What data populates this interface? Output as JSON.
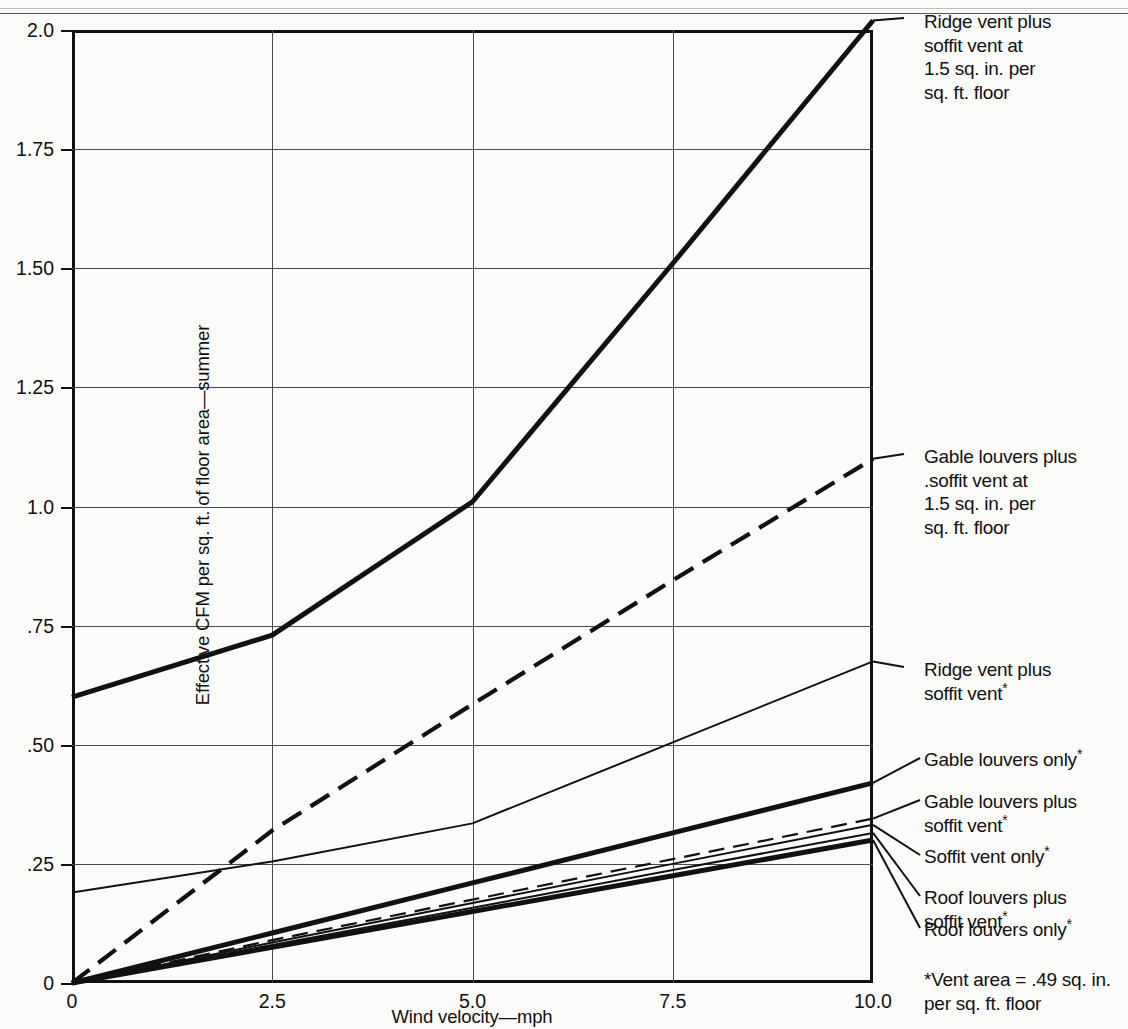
{
  "chart_data": {
    "type": "line",
    "title": "",
    "xlabel": "Wind velocity—mph",
    "ylabel": "Effective CFM per sq. ft. of floor area—summer",
    "xlim": [
      0,
      10
    ],
    "ylim": [
      0,
      2.0
    ],
    "xticks": [
      "0",
      "2.5",
      "5.0",
      "7.5",
      "10.0"
    ],
    "xtick_values": [
      0,
      2.5,
      5.0,
      7.5,
      10.0
    ],
    "yticks": [
      "0",
      ".25",
      ".50",
      ".75",
      "1.0",
      "1.25",
      "1.50",
      "1.75",
      "2.0"
    ],
    "ytick_values": [
      0,
      0.25,
      0.5,
      0.75,
      1.0,
      1.25,
      1.5,
      1.75,
      2.0
    ],
    "grid": true,
    "legend_position": "right-callouts",
    "x": [
      0,
      2.5,
      5.0,
      7.5,
      10.0
    ],
    "series": [
      {
        "name": "Ridge vent plus soffit vent at 1.5 sq. in. per sq. ft. floor",
        "values": [
          0.6,
          0.73,
          1.01,
          1.51,
          2.02
        ],
        "style": "solid-heavy"
      },
      {
        "name": "Gable louvers plus soffit vent at 1.5 sq. in. per sq. ft. floor",
        "values": [
          0.0,
          0.32,
          0.585,
          0.845,
          1.1
        ],
        "style": "dashed-heavy"
      },
      {
        "name": "Ridge vent plus soffit vent*",
        "values": [
          0.19,
          0.255,
          0.335,
          0.505,
          0.675
        ],
        "style": "solid-thin"
      },
      {
        "name": "Gable louvers only*",
        "values": [
          0.0,
          0.105,
          0.21,
          0.315,
          0.42
        ],
        "style": "solid-heavy"
      },
      {
        "name": "Gable louvers plus soffit vent*",
        "values": [
          0.0,
          0.09,
          0.175,
          0.26,
          0.345
        ],
        "style": "dashed-thin"
      },
      {
        "name": "Soffit vent only*",
        "values": [
          0.0,
          0.085,
          0.168,
          0.25,
          0.332
        ],
        "style": "solid-thin"
      },
      {
        "name": "Roof louvers plus soffit vent*",
        "values": [
          0.0,
          0.08,
          0.158,
          0.237,
          0.315
        ],
        "style": "solid-thin"
      },
      {
        "name": "Roof louvers only*",
        "values": [
          0.0,
          0.075,
          0.15,
          0.225,
          0.3
        ],
        "style": "solid-heavy"
      }
    ]
  },
  "callouts": [
    {
      "id": "ridge-soffit-15",
      "lines": [
        "Ridge vent plus",
        "soffit vent at",
        "1.5 sq. in. per",
        "sq. ft. floor"
      ]
    },
    {
      "id": "gable-soffit-15",
      "lines": [
        "Gable louvers plus",
        ".soffit vent at",
        "1.5 sq. in. per",
        "sq. ft. floor"
      ]
    },
    {
      "id": "ridge-soffit",
      "lines": [
        "Ridge vent plus",
        "soffit vent*"
      ]
    },
    {
      "id": "gable-only",
      "lines": [
        "Gable louvers only*"
      ]
    },
    {
      "id": "gable-soffit",
      "lines": [
        "Gable louvers plus",
        "soffit vent*"
      ]
    },
    {
      "id": "soffit-only",
      "lines": [
        "Soffit vent only*"
      ]
    },
    {
      "id": "roof-soffit",
      "lines": [
        "Roof louvers plus",
        "soffit vent*"
      ]
    },
    {
      "id": "roof-only",
      "lines": [
        "Roof louvers only*"
      ]
    }
  ],
  "footnote": {
    "line1": "*Vent area = .49 sq. in.",
    "line2": "per sq. ft. floor"
  },
  "colors": {
    "ink": "#111111",
    "grid": "#4a4a48",
    "paper": "#fbfbf9"
  }
}
